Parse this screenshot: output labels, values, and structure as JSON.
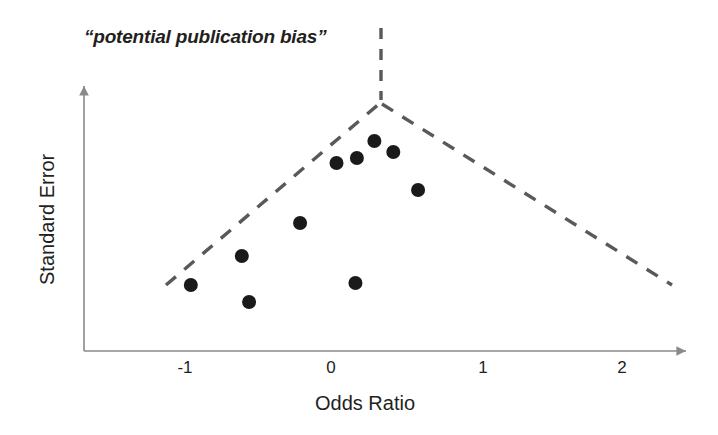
{
  "figure": {
    "annotation": "“potential publication bias”",
    "background": "#ffffff",
    "ink_color": "#231f20"
  },
  "chart_data": {
    "type": "scatter",
    "title": "",
    "annotations": [
      {
        "text": "“potential publication bias”",
        "x": -1.33,
        "y_px": 38,
        "style": "italic"
      }
    ],
    "xlabel": "Odds Ratio",
    "ylabel": "Standard Error",
    "xlim": [
      -1.7,
      2.47
    ],
    "xticks": [
      -1,
      0,
      1,
      2
    ],
    "xticklabels": [
      "-1",
      "0",
      "1",
      "2"
    ],
    "yticks": [],
    "yticklabels": [],
    "grid": false,
    "legend": null,
    "axis_style": "arrow-ended open axes (left spine and bottom spine only)",
    "marker": {
      "shape": "circle",
      "color": "#1a1a1a",
      "radius_px": 7
    },
    "points": [
      {
        "x": -0.96,
        "y_px": 285,
        "label": "p1"
      },
      {
        "x": -0.61,
        "y_px": 256,
        "label": "p2"
      },
      {
        "x": -0.56,
        "y_px": 302,
        "label": "p3"
      },
      {
        "x": -0.21,
        "y_px": 223,
        "label": "p4"
      },
      {
        "x": 0.04,
        "y_px": 163,
        "label": "p5"
      },
      {
        "x": 0.18,
        "y_px": 158,
        "label": "p6"
      },
      {
        "x": 0.17,
        "y_px": 283,
        "label": "p7"
      },
      {
        "x": 0.3,
        "y_px": 141,
        "label": "p8"
      },
      {
        "x": 0.43,
        "y_px": 152,
        "label": "p9"
      },
      {
        "x": 0.6,
        "y_px": 190,
        "label": "p10"
      }
    ],
    "funnel": {
      "style": "dashed",
      "color": "#58595b",
      "apex": {
        "x": 0.34,
        "y_px": 103
      },
      "left_end": {
        "x": -1.13,
        "y_px": 285
      },
      "right_end": {
        "x": 2.33,
        "y_px": 285
      },
      "center_line": {
        "x": 0.34,
        "y_top_px": 28,
        "y_bottom_px": 100
      }
    }
  },
  "axes": {
    "x_title": "Odds Ratio",
    "y_title": "Standard Error",
    "x_ticks": [
      {
        "label": "-1",
        "px": 185
      },
      {
        "label": "0",
        "px": 331
      },
      {
        "label": "1",
        "px": 483
      },
      {
        "label": "2",
        "px": 622
      }
    ]
  }
}
